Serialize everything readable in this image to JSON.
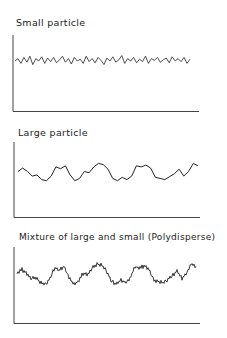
{
  "figure": {
    "panels": [
      {
        "title": "Small particle"
      },
      {
        "title": "Large particle"
      },
      {
        "title": "Mixture of large and small (Polydisperse)"
      }
    ]
  },
  "chart_data": [
    {
      "type": "line",
      "title": "Small particle",
      "xlabel": "",
      "ylabel": "",
      "grid": false,
      "description": "High-frequency, low-amplitude fluctuating intensity trace",
      "series": [
        {
          "name": "intensity",
          "values": [
            0.5,
            0.7,
            0.3,
            0.8,
            0.4,
            0.9,
            0.2,
            0.7,
            0.5,
            0.85,
            0.3,
            0.75,
            0.45,
            0.8,
            0.35,
            0.6,
            0.9,
            0.4,
            0.7,
            0.25,
            0.8,
            0.5,
            0.65,
            0.3,
            0.9,
            0.45,
            0.7,
            0.35,
            0.8,
            0.55,
            0.2,
            0.75,
            0.5,
            0.85,
            0.4,
            0.6,
            0.95,
            0.3,
            0.7,
            0.5,
            0.8,
            0.35,
            0.65,
            0.45,
            0.9,
            0.3,
            0.7,
            0.55,
            0.8,
            0.4,
            0.6,
            0.75,
            0.35,
            0.85,
            0.5,
            0.7,
            0.45,
            0.8,
            0.3,
            0.65
          ]
        }
      ]
    },
    {
      "type": "line",
      "title": "Large particle",
      "xlabel": "",
      "ylabel": "",
      "grid": false,
      "description": "Low-frequency, large-amplitude fluctuating intensity trace",
      "series": [
        {
          "name": "intensity",
          "values": [
            0.5,
            0.65,
            0.5,
            0.3,
            0.35,
            0.15,
            0.1,
            0.3,
            0.7,
            0.62,
            0.75,
            0.35,
            0.1,
            0.2,
            0.5,
            0.45,
            0.7,
            0.85,
            0.8,
            0.6,
            0.2,
            0.1,
            0.25,
            0.15,
            0.3,
            0.75,
            0.7,
            0.78,
            0.65,
            0.25,
            0.2,
            0.15,
            0.28,
            0.4,
            0.6,
            0.3,
            0.5,
            0.85,
            0.75
          ]
        }
      ]
    },
    {
      "type": "line",
      "title": "Mixture of large and small (Polydisperse)",
      "xlabel": "",
      "ylabel": "",
      "grid": false,
      "description": "Superposition of slow large-amplitude and fast small-amplitude fluctuations",
      "series": [
        {
          "name": "intensity",
          "values": [
            0.5,
            0.65,
            0.5,
            0.3,
            0.35,
            0.15,
            0.1,
            0.3,
            0.7,
            0.62,
            0.75,
            0.35,
            0.1,
            0.2,
            0.5,
            0.45,
            0.7,
            0.85,
            0.8,
            0.6,
            0.2,
            0.1,
            0.25,
            0.15,
            0.3,
            0.75,
            0.7,
            0.78,
            0.65,
            0.25,
            0.2,
            0.15,
            0.28,
            0.4,
            0.6,
            0.3,
            0.5,
            0.85,
            0.75
          ]
        }
      ]
    }
  ]
}
